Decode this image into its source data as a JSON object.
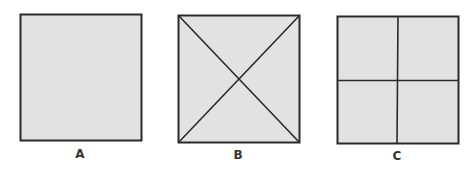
{
  "diagram": {
    "fill_color": "#e2e2e2",
    "stroke_color": "#2a2a2a",
    "panels": [
      {
        "label": "A",
        "division": "none"
      },
      {
        "label": "B",
        "division": "diagonals"
      },
      {
        "label": "C",
        "division": "quarters"
      }
    ]
  }
}
